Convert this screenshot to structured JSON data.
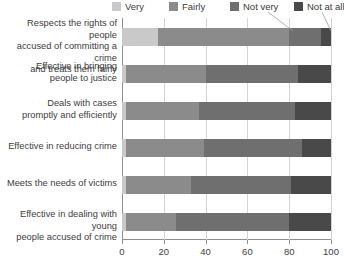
{
  "chart_data": {
    "type": "bar",
    "orientation": "horizontal",
    "stacked": true,
    "normalized_percent": true,
    "title": "",
    "subtitle": "",
    "xlabel": "",
    "ylabel": "",
    "xlim": [
      0,
      100
    ],
    "xticks": [
      0,
      20,
      40,
      60,
      80,
      100
    ],
    "xtick_labels": [
      "0",
      "20",
      "40",
      "60",
      "80",
      "100"
    ],
    "grid": true,
    "grid_axis": "x",
    "legend_position": "top",
    "categories": [
      "Respects the rights of people accused of committing a crime and treats them fairly",
      "Effective in bringing people to justice",
      "Deals with cases promptly and efficiently",
      "Effective in reducing crime",
      "Meets the needs of victims",
      "Effective in dealing with young people accused of crime"
    ],
    "category_lines": [
      [
        "Respects the rights of people",
        "accused of committing a crime",
        "and treats them fairly"
      ],
      [
        "Effective in bringing",
        "people to justice"
      ],
      [
        "Deals with cases",
        "promptly and efficiently"
      ],
      [
        "Effective in reducing crime"
      ],
      [
        "Meets the needs of victims"
      ],
      [
        "Effective in dealing with young",
        "people accused of crime"
      ]
    ],
    "series": [
      {
        "name": "Very",
        "color": "#c9c9c9",
        "values": [
          17,
          2,
          2,
          2,
          2,
          2
        ]
      },
      {
        "name": "Fairly",
        "color": "#8b8b8b",
        "values": [
          63,
          38,
          35,
          37,
          31,
          24
        ]
      },
      {
        "name": "Not very",
        "color": "#6f6f6f",
        "values": [
          15,
          44,
          46,
          47,
          48,
          54
        ]
      },
      {
        "name": "Not at all",
        "color": "#494949",
        "values": [
          5,
          16,
          17,
          14,
          19,
          20
        ]
      }
    ],
    "annotations": [
      {
        "name": "leader-not-very",
        "from_label": "Not very",
        "to_series": "Not very",
        "to_category_index": 0
      },
      {
        "name": "leader-not-at-all",
        "from_label": "Not at all",
        "to_series": "Not at all",
        "to_category_index": 0
      }
    ]
  },
  "legend": {
    "items": [
      {
        "label": "Very"
      },
      {
        "label": "Fairly"
      },
      {
        "label": "Not very"
      },
      {
        "label": "Not at all"
      }
    ]
  }
}
